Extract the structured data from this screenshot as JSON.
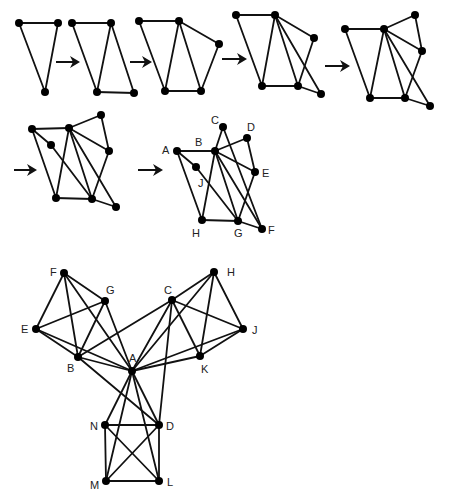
{
  "figure": {
    "colors": {
      "edge": "#111111",
      "node": "#000000",
      "label": "#222222",
      "background": "#ffffff"
    },
    "node_radius": 4,
    "arrows": [
      {
        "x1": 56,
        "y1": 62,
        "x2": 80,
        "y2": 62
      },
      {
        "x1": 130,
        "y1": 62,
        "x2": 152,
        "y2": 62
      },
      {
        "x1": 222,
        "y1": 59,
        "x2": 247,
        "y2": 59
      },
      {
        "x1": 325,
        "y1": 66,
        "x2": 350,
        "y2": 66
      },
      {
        "x1": 14,
        "y1": 170,
        "x2": 37,
        "y2": 170
      },
      {
        "x1": 138,
        "y1": 170,
        "x2": 163,
        "y2": 170
      }
    ],
    "graphs": [
      {
        "id": "step-1",
        "nodes": [
          {
            "id": "1",
            "x": 19,
            "y": 23
          },
          {
            "id": "2",
            "x": 58,
            "y": 23
          },
          {
            "id": "3",
            "x": 45,
            "y": 92
          }
        ],
        "edges": [
          [
            "1",
            "2"
          ],
          [
            "1",
            "3"
          ],
          [
            "2",
            "3"
          ]
        ]
      },
      {
        "id": "step-2",
        "nodes": [
          {
            "id": "1",
            "x": 72,
            "y": 23
          },
          {
            "id": "2",
            "x": 111,
            "y": 23
          },
          {
            "id": "3",
            "x": 97,
            "y": 92
          },
          {
            "id": "4",
            "x": 134,
            "y": 93
          }
        ],
        "edges": [
          [
            "1",
            "2"
          ],
          [
            "1",
            "3"
          ],
          [
            "2",
            "3"
          ],
          [
            "2",
            "4"
          ],
          [
            "3",
            "4"
          ]
        ]
      },
      {
        "id": "step-3",
        "nodes": [
          {
            "id": "1",
            "x": 139,
            "y": 21
          },
          {
            "id": "2",
            "x": 179,
            "y": 21
          },
          {
            "id": "3",
            "x": 165,
            "y": 91
          },
          {
            "id": "4",
            "x": 201,
            "y": 91
          },
          {
            "id": "5",
            "x": 219,
            "y": 44
          }
        ],
        "edges": [
          [
            "1",
            "2"
          ],
          [
            "1",
            "3"
          ],
          [
            "2",
            "3"
          ],
          [
            "2",
            "4"
          ],
          [
            "3",
            "4"
          ],
          [
            "2",
            "5"
          ],
          [
            "4",
            "5"
          ]
        ]
      },
      {
        "id": "step-4",
        "nodes": [
          {
            "id": "1",
            "x": 236,
            "y": 15
          },
          {
            "id": "2",
            "x": 275,
            "y": 15
          },
          {
            "id": "3",
            "x": 262,
            "y": 86
          },
          {
            "id": "4",
            "x": 298,
            "y": 86
          },
          {
            "id": "5",
            "x": 314,
            "y": 38
          },
          {
            "id": "6",
            "x": 321,
            "y": 94
          }
        ],
        "edges": [
          [
            "1",
            "2"
          ],
          [
            "1",
            "3"
          ],
          [
            "2",
            "3"
          ],
          [
            "2",
            "4"
          ],
          [
            "3",
            "4"
          ],
          [
            "2",
            "5"
          ],
          [
            "4",
            "5"
          ],
          [
            "2",
            "6"
          ],
          [
            "4",
            "6"
          ]
        ]
      },
      {
        "id": "step-5",
        "nodes": [
          {
            "id": "1",
            "x": 345,
            "y": 29
          },
          {
            "id": "2",
            "x": 384,
            "y": 29
          },
          {
            "id": "3",
            "x": 370,
            "y": 98
          },
          {
            "id": "4",
            "x": 405,
            "y": 98
          },
          {
            "id": "5",
            "x": 422,
            "y": 51
          },
          {
            "id": "6",
            "x": 430,
            "y": 106
          },
          {
            "id": "7",
            "x": 415,
            "y": 15
          }
        ],
        "edges": [
          [
            "1",
            "2"
          ],
          [
            "1",
            "3"
          ],
          [
            "2",
            "3"
          ],
          [
            "2",
            "4"
          ],
          [
            "3",
            "4"
          ],
          [
            "2",
            "5"
          ],
          [
            "4",
            "5"
          ],
          [
            "2",
            "6"
          ],
          [
            "4",
            "6"
          ],
          [
            "2",
            "7"
          ],
          [
            "5",
            "7"
          ]
        ]
      },
      {
        "id": "step-6",
        "nodes": [
          {
            "id": "A",
            "x": 32,
            "y": 129
          },
          {
            "id": "B",
            "x": 69,
            "y": 128
          },
          {
            "id": "H",
            "x": 56,
            "y": 198
          },
          {
            "id": "G",
            "x": 92,
            "y": 199
          },
          {
            "id": "E",
            "x": 109,
            "y": 151
          },
          {
            "id": "F",
            "x": 116,
            "y": 207
          },
          {
            "id": "D",
            "x": 101,
            "y": 115
          },
          {
            "id": "J",
            "x": 51,
            "y": 145
          }
        ],
        "edges": [
          [
            "A",
            "B"
          ],
          [
            "A",
            "H"
          ],
          [
            "B",
            "H"
          ],
          [
            "B",
            "G"
          ],
          [
            "H",
            "G"
          ],
          [
            "B",
            "E"
          ],
          [
            "G",
            "E"
          ],
          [
            "B",
            "F"
          ],
          [
            "G",
            "F"
          ],
          [
            "B",
            "D"
          ],
          [
            "E",
            "D"
          ],
          [
            "A",
            "J"
          ],
          [
            "J",
            "G"
          ]
        ]
      },
      {
        "id": "step-7",
        "nodes": [
          {
            "id": "A",
            "x": 177,
            "y": 151,
            "label": "A",
            "lx": 162,
            "ly": 154
          },
          {
            "id": "B",
            "x": 215,
            "y": 151,
            "label": "B",
            "lx": 195,
            "ly": 146
          },
          {
            "id": "C",
            "x": 223,
            "y": 127,
            "label": "C",
            "lx": 211,
            "ly": 124
          },
          {
            "id": "D",
            "x": 247,
            "y": 138,
            "label": "D",
            "lx": 247,
            "ly": 131
          },
          {
            "id": "E",
            "x": 255,
            "y": 172,
            "label": "E",
            "lx": 262,
            "ly": 177
          },
          {
            "id": "J",
            "x": 196,
            "y": 167,
            "label": "J",
            "lx": 198,
            "ly": 187
          },
          {
            "id": "H",
            "x": 202,
            "y": 220,
            "label": "H",
            "lx": 192,
            "ly": 237
          },
          {
            "id": "G",
            "x": 238,
            "y": 221,
            "label": "G",
            "lx": 234,
            "ly": 237
          },
          {
            "id": "F",
            "x": 262,
            "y": 229,
            "label": "F",
            "lx": 268,
            "ly": 234
          }
        ],
        "edges": [
          [
            "A",
            "B"
          ],
          [
            "A",
            "H"
          ],
          [
            "B",
            "H"
          ],
          [
            "B",
            "G"
          ],
          [
            "H",
            "G"
          ],
          [
            "B",
            "E"
          ],
          [
            "G",
            "E"
          ],
          [
            "B",
            "F"
          ],
          [
            "G",
            "F"
          ],
          [
            "B",
            "D"
          ],
          [
            "E",
            "D"
          ],
          [
            "A",
            "J"
          ],
          [
            "J",
            "G"
          ],
          [
            "B",
            "C"
          ],
          [
            "C",
            "F"
          ]
        ]
      },
      {
        "id": "full-graph",
        "nodes": [
          {
            "id": "A",
            "x": 132,
            "y": 371,
            "label": "A",
            "lx": 129,
            "ly": 362
          },
          {
            "id": "B",
            "x": 78,
            "y": 357,
            "label": "B",
            "lx": 67,
            "ly": 372
          },
          {
            "id": "C",
            "x": 172,
            "y": 300,
            "label": "C",
            "lx": 164,
            "ly": 294
          },
          {
            "id": "D",
            "x": 159,
            "y": 425,
            "label": "D",
            "lx": 166,
            "ly": 430
          },
          {
            "id": "E",
            "x": 36,
            "y": 329,
            "label": "E",
            "lx": 21,
            "ly": 333
          },
          {
            "id": "F",
            "x": 64,
            "y": 273,
            "label": "F",
            "lx": 50,
            "ly": 276
          },
          {
            "id": "G",
            "x": 105,
            "y": 301,
            "label": "G",
            "lx": 106,
            "ly": 294
          },
          {
            "id": "H",
            "x": 214,
            "y": 272,
            "label": "H",
            "lx": 227,
            "ly": 276
          },
          {
            "id": "J",
            "x": 243,
            "y": 329,
            "label": "J",
            "lx": 252,
            "ly": 334
          },
          {
            "id": "K",
            "x": 200,
            "y": 356,
            "label": "K",
            "lx": 201,
            "ly": 373
          },
          {
            "id": "N",
            "x": 105,
            "y": 425,
            "label": "N",
            "lx": 90,
            "ly": 430
          },
          {
            "id": "M",
            "x": 106,
            "y": 481,
            "label": "M",
            "lx": 90,
            "ly": 489
          },
          {
            "id": "L",
            "x": 159,
            "y": 481,
            "label": "L",
            "lx": 167,
            "ly": 486
          }
        ],
        "edges": [
          [
            "F",
            "G"
          ],
          [
            "F",
            "E"
          ],
          [
            "F",
            "B"
          ],
          [
            "F",
            "A"
          ],
          [
            "G",
            "E"
          ],
          [
            "G",
            "B"
          ],
          [
            "G",
            "A"
          ],
          [
            "E",
            "B"
          ],
          [
            "E",
            "A"
          ],
          [
            "B",
            "A"
          ],
          [
            "B",
            "C"
          ],
          [
            "B",
            "D"
          ],
          [
            "C",
            "H"
          ],
          [
            "C",
            "J"
          ],
          [
            "C",
            "K"
          ],
          [
            "C",
            "A"
          ],
          [
            "C",
            "D"
          ],
          [
            "H",
            "J"
          ],
          [
            "H",
            "K"
          ],
          [
            "H",
            "A"
          ],
          [
            "J",
            "K"
          ],
          [
            "J",
            "A"
          ],
          [
            "K",
            "A"
          ],
          [
            "A",
            "N"
          ],
          [
            "A",
            "D"
          ],
          [
            "A",
            "M"
          ],
          [
            "A",
            "L"
          ],
          [
            "N",
            "D"
          ],
          [
            "N",
            "M"
          ],
          [
            "N",
            "L"
          ],
          [
            "D",
            "M"
          ],
          [
            "D",
            "L"
          ],
          [
            "M",
            "L"
          ]
        ]
      }
    ]
  }
}
